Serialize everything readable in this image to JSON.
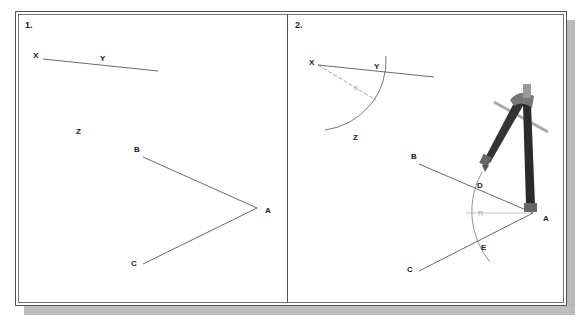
{
  "panels": [
    {
      "label": "1.",
      "points": {
        "X": "X",
        "Y": "Y",
        "Z": "Z",
        "A": "A",
        "B": "B",
        "C": "C"
      }
    },
    {
      "label": "2.",
      "points": {
        "X": "X",
        "Y": "Y",
        "Z": "Z",
        "A": "A",
        "B": "B",
        "C": "C",
        "D": "D",
        "E": "E"
      },
      "radius_label": "R",
      "tool": "compass-icon"
    }
  ]
}
